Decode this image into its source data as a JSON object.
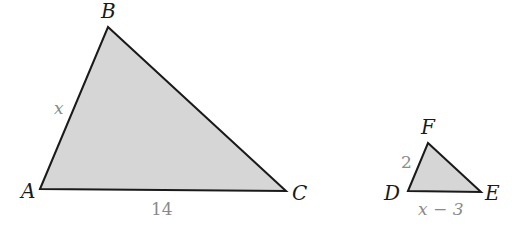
{
  "figure": {
    "triangle_abc": {
      "vertices": {
        "A": "A",
        "B": "B",
        "C": "C"
      },
      "sides": {
        "AB": "x",
        "AC": "14"
      },
      "fill": "#d6d6d6",
      "stroke": "#1a1a1a"
    },
    "triangle_def": {
      "vertices": {
        "D": "D",
        "E": "E",
        "F": "F"
      },
      "sides": {
        "DF": "2",
        "DE": "x − 3"
      },
      "fill": "#d6d6d6",
      "stroke": "#1a1a1a"
    }
  }
}
